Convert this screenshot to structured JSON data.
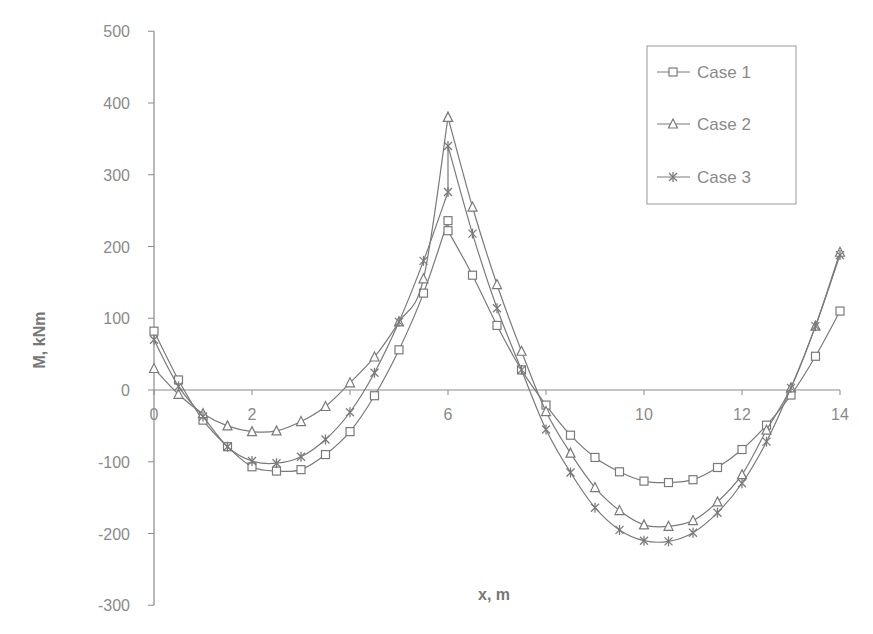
{
  "chart_data": {
    "type": "line",
    "title": "",
    "xlabel": "x, m",
    "ylabel": "M, kNm",
    "xlim": [
      0,
      14
    ],
    "ylim": [
      -300,
      500
    ],
    "x_ticks": [
      0,
      2,
      6,
      10,
      12,
      14
    ],
    "x_tick_labels": [
      "0",
      "2",
      "6",
      "10",
      "12",
      "14"
    ],
    "y_ticks": [
      500,
      400,
      300,
      200,
      100,
      0,
      -100,
      -200,
      -300
    ],
    "y_tick_labels": [
      "500",
      "400",
      "300",
      "200",
      "100",
      "0",
      "-100",
      "-200",
      "-300"
    ],
    "grid": false,
    "legend_position": "upper right",
    "series": [
      {
        "name": "Case 1",
        "marker": "square",
        "x": [
          0,
          0.5,
          1,
          1.5,
          2,
          2.5,
          3,
          3.5,
          4,
          4.5,
          5,
          5.5,
          6,
          6,
          6.5,
          7,
          7.5,
          8,
          8.5,
          9,
          9.5,
          10,
          10.5,
          11,
          11.5,
          12,
          12.5,
          13,
          13.5,
          14
        ],
        "values": [
          82,
          14,
          -42,
          -79,
          -107,
          -113,
          -111,
          -90,
          -58,
          -8,
          56,
          135,
          236,
          222,
          160,
          90,
          28,
          -21,
          -63,
          -94,
          -114,
          -127,
          -129,
          -125,
          -108,
          -83,
          -49,
          -7,
          47,
          110
        ]
      },
      {
        "name": "Case 2",
        "marker": "triangle",
        "x": [
          0,
          0.5,
          1,
          1.5,
          2,
          2.5,
          3,
          3.5,
          4,
          4.5,
          5,
          5.5,
          6,
          6,
          6.5,
          7,
          7.5,
          8,
          8.5,
          9,
          9.5,
          10,
          10.5,
          11,
          11.5,
          12,
          12.5,
          13,
          13.5,
          14
        ],
        "values": [
          30,
          -6,
          -33,
          -50,
          -58,
          -57,
          -44,
          -23,
          10,
          46,
          95,
          155,
          380,
          380,
          255,
          147,
          54,
          -30,
          -88,
          -136,
          -168,
          -188,
          -190,
          -182,
          -156,
          -118,
          -56,
          3,
          89,
          192
        ]
      },
      {
        "name": "Case 3",
        "marker": "star",
        "x": [
          0,
          0.5,
          1,
          1.5,
          2,
          2.5,
          3,
          3.5,
          4,
          4.5,
          5,
          5.5,
          6,
          6,
          6.5,
          7,
          7.5,
          8,
          8.5,
          9,
          9.5,
          10,
          10.5,
          11,
          11.5,
          12,
          12.5,
          13,
          13.5,
          14
        ],
        "values": [
          70,
          5,
          -37,
          -79,
          -99,
          -102,
          -93,
          -69,
          -31,
          24,
          95,
          180,
          276,
          340,
          218,
          114,
          28,
          -55,
          -115,
          -164,
          -195,
          -210,
          -211,
          -199,
          -171,
          -130,
          -72,
          3,
          89,
          188
        ]
      }
    ]
  },
  "legend": {
    "items": [
      {
        "label": "Case 1",
        "marker": "square"
      },
      {
        "label": "Case 2",
        "marker": "triangle"
      },
      {
        "label": "Case 3",
        "marker": "star"
      }
    ]
  },
  "colors": {
    "line": "#7a7a7a",
    "axis": "#8a8a8a",
    "text": "#8a8a8a"
  }
}
